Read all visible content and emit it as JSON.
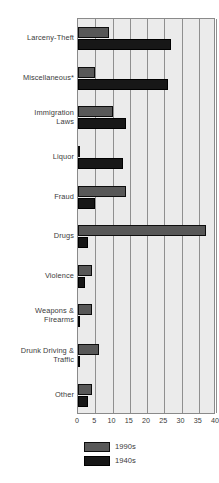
{
  "chart_data": {
    "type": "bar",
    "orientation": "horizontal",
    "title": "",
    "xlabel": "",
    "ylabel": "",
    "xlim": [
      0,
      40
    ],
    "xticks": [
      0,
      5,
      10,
      15,
      20,
      25,
      30,
      35,
      40
    ],
    "grid": true,
    "legend_position": "bottom",
    "categories": [
      "Larceny-Theft",
      "Miscellaneous*",
      "Immigration Laws",
      "Liquor",
      "Fraud",
      "Drugs",
      "Violence",
      "Weapons & Firearms",
      "Drunk Driving & Traffic",
      "Other"
    ],
    "series": [
      {
        "name": "1990s",
        "color": "#585858",
        "values": [
          9,
          5,
          10,
          0.4,
          14,
          37,
          4,
          4,
          6,
          4
        ]
      },
      {
        "name": "1940s",
        "color": "#171717",
        "values": [
          27,
          26,
          14,
          13,
          5,
          3,
          2,
          0.4,
          0.4,
          3
        ]
      }
    ]
  },
  "category_labels": [
    [
      "Larceny-Theft"
    ],
    [
      "Miscellaneous*"
    ],
    [
      "Immigration",
      "Laws"
    ],
    [
      "Liquor"
    ],
    [
      "Fraud"
    ],
    [
      "Drugs"
    ],
    [
      "Violence"
    ],
    [
      "Weapons &",
      "Firearms"
    ],
    [
      "Drunk Driving &",
      "Traffic"
    ],
    [
      "Other"
    ]
  ],
  "axis": {
    "tick_labels": [
      "0",
      "5",
      "10",
      "15",
      "20",
      "25",
      "30",
      "35",
      "40"
    ]
  },
  "legend": {
    "items": [
      {
        "label": "1990s",
        "key": "s90"
      },
      {
        "label": "1940s",
        "key": "s40"
      }
    ]
  },
  "top_note": ""
}
